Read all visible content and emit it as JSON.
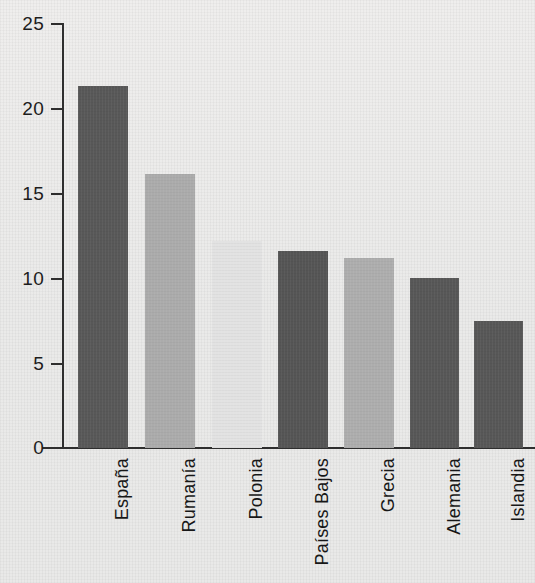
{
  "chart_data": {
    "type": "bar",
    "title": "",
    "subtitle": "",
    "xlabel": "",
    "ylabel": "",
    "categories": [
      "España",
      "Rumanía",
      "Polonia",
      "Países Bajos",
      "Grecia",
      "Alemania",
      "Islandia"
    ],
    "values": [
      21.3,
      16.1,
      12.2,
      11.6,
      11.2,
      10.0,
      7.5
    ],
    "bar_colors": [
      "#585858",
      "#ababab",
      "#e2e2e2",
      "#555555",
      "#adadad",
      "#575757",
      "#575757"
    ],
    "ylim": [
      0,
      25
    ],
    "yticks": [
      0,
      5,
      10,
      15,
      20,
      25
    ],
    "ytick_labels": [
      "0",
      "5",
      "10",
      "15",
      "20",
      "25"
    ],
    "grid": false,
    "legend": null,
    "legend_position": "none",
    "annotations": [],
    "axis_color": "#2e2e2e",
    "background_color": "#ececeb"
  }
}
